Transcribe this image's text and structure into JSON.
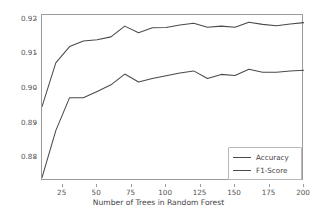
{
  "chart_data": {
    "type": "line",
    "title": "",
    "xlabel": "Number of Trees in Random Forest",
    "ylabel": "",
    "xlim": [
      10,
      200
    ],
    "ylim": [
      0.8735,
      0.9213
    ],
    "grid": false,
    "legend_position": "lower right",
    "xticks": [
      25,
      50,
      75,
      100,
      125,
      150,
      175,
      200
    ],
    "xtick_labels": [
      "25",
      "50",
      "75",
      "100",
      "125",
      "150",
      "175",
      "200"
    ],
    "yticks": [
      0.88,
      0.89,
      0.9,
      0.91,
      0.92
    ],
    "ytick_labels": [
      "0.88",
      "0.89",
      "0.90",
      "0.91",
      "0.92"
    ],
    "x": [
      10,
      20,
      30,
      40,
      50,
      60,
      70,
      80,
      90,
      100,
      110,
      120,
      130,
      140,
      150,
      160,
      170,
      180,
      190,
      200
    ],
    "series": [
      {
        "name": "Accuracy",
        "color": "#4a4a4a",
        "values": [
          0.8949,
          0.9075,
          0.9122,
          0.9138,
          0.9142,
          0.915,
          0.9181,
          0.9162,
          0.9176,
          0.9177,
          0.9184,
          0.9189,
          0.9178,
          0.9181,
          0.9178,
          0.9192,
          0.9186,
          0.9182,
          0.9187,
          0.9191
        ]
      },
      {
        "name": "F1-Score",
        "color": "#4a4a4a",
        "values": [
          0.8745,
          0.888,
          0.8975,
          0.8975,
          0.8993,
          0.9012,
          0.9043,
          0.902,
          0.903,
          0.9038,
          0.9046,
          0.9052,
          0.903,
          0.9042,
          0.9039,
          0.9057,
          0.9048,
          0.9048,
          0.9052,
          0.9054
        ]
      }
    ]
  },
  "legend": {
    "items": [
      {
        "label": "Accuracy"
      },
      {
        "label": "F1-Score"
      }
    ]
  }
}
